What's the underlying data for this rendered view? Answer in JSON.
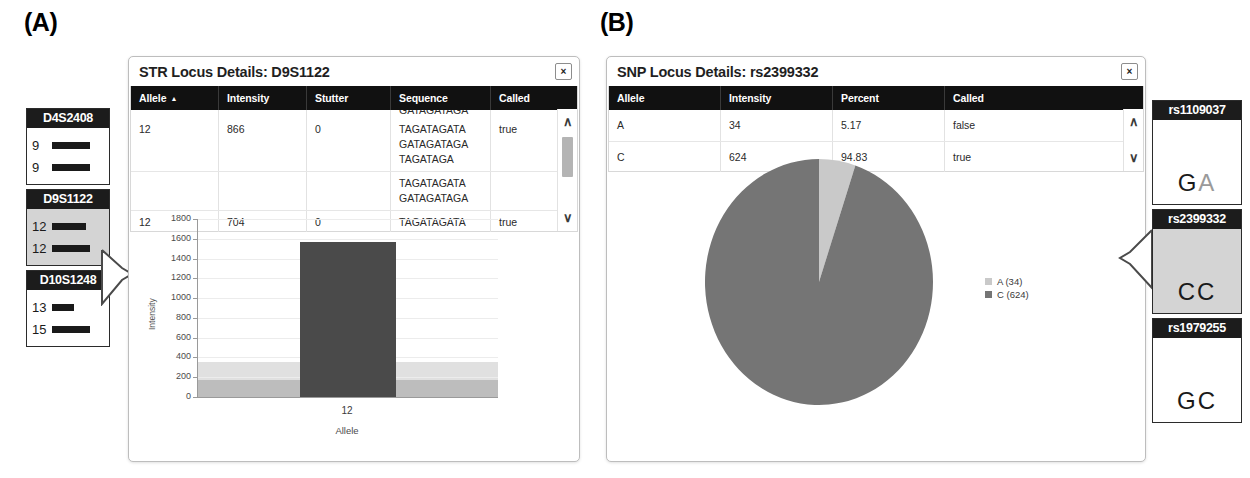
{
  "panels": {
    "a_letter": "(A)",
    "b_letter": "(B)"
  },
  "colors": {
    "header_bar": "#111111",
    "bar_fill": "#4a4a4a",
    "pie_major": "#757575",
    "pie_minor": "#c9c9c9",
    "selected_chip": "#d4d4d4",
    "band_light": "#e0e0e0",
    "band_dark": "#bdbdbd"
  },
  "panel_a": {
    "sidebar": {
      "loci": [
        {
          "name": "D4S2408",
          "selected": false,
          "alleles": [
            {
              "label": "9",
              "width": 38
            },
            {
              "label": "9",
              "width": 38
            }
          ]
        },
        {
          "name": "D9S1122",
          "selected": true,
          "alleles": [
            {
              "label": "12",
              "width": 34
            },
            {
              "label": "12",
              "width": 38
            }
          ]
        },
        {
          "name": "D10S1248",
          "selected": false,
          "alleles": [
            {
              "label": "13",
              "width": 22
            },
            {
              "label": "15",
              "width": 38
            }
          ]
        }
      ]
    },
    "dialog": {
      "title": "STR Locus Details: D9S1122",
      "close_label": "×",
      "table": {
        "columns": [
          "Allele",
          "Intensity",
          "Stutter",
          "Sequence",
          "Called"
        ],
        "sort_column": "Allele",
        "sort_arrow": "▲",
        "clipped_top_sequence": "GATAGATAGA",
        "rows": [
          {
            "allele": "12",
            "intensity": "866",
            "stutter": "0",
            "sequence": [
              "TAGATAGATA",
              "GATAGATAGA",
              "TAGATAGA"
            ],
            "called": "true"
          },
          {
            "allele": "",
            "intensity": "",
            "stutter": "",
            "sequence": [
              "TAGATAGATA",
              "GATAGATAGA"
            ],
            "called": ""
          },
          {
            "allele": "12",
            "intensity": "704",
            "stutter": "0",
            "sequence": [
              "TAGATAGATA"
            ],
            "called": "true"
          }
        ],
        "scroll_up": "∧",
        "scroll_down": "∨"
      }
    },
    "chart_data": {
      "type": "bar",
      "title": "",
      "xlabel": "Allele",
      "ylabel": "Intensity",
      "categories": [
        "12"
      ],
      "values": [
        1570
      ],
      "ylim": [
        0,
        1800
      ],
      "yticks": [
        0,
        200,
        400,
        600,
        800,
        1000,
        1200,
        1400,
        1600,
        1800
      ],
      "grid": true,
      "legend": "none",
      "threshold_bands": [
        {
          "name": "analytical-threshold-band",
          "from": 0,
          "to": 350,
          "color": "#e0e0e0"
        },
        {
          "name": "stutter-threshold-band",
          "from": 0,
          "to": 170,
          "color": "#bdbdbd"
        }
      ]
    }
  },
  "panel_b": {
    "dialog": {
      "title": "SNP Locus Details: rs2399332",
      "close_label": "×",
      "table": {
        "columns": [
          "Allele",
          "Intensity",
          "Percent",
          "Called"
        ],
        "rows": [
          {
            "allele": "A",
            "intensity": "34",
            "percent": "5.17",
            "called": "false"
          },
          {
            "allele": "C",
            "intensity": "624",
            "percent": "94.83",
            "called": "true"
          }
        ],
        "scroll_up": "∧",
        "scroll_down": "∨"
      }
    },
    "chart_data": {
      "type": "pie",
      "title": "",
      "labels": [
        "A (34)",
        "C (624)"
      ],
      "slice_names": [
        "A",
        "C"
      ],
      "values": [
        34,
        624
      ],
      "percents": [
        5.17,
        94.83
      ],
      "colors": [
        "#c9c9c9",
        "#757575"
      ],
      "legend": "right",
      "start_angle_deg": 0
    },
    "sidebar": {
      "loci": [
        {
          "name": "rs1109037",
          "selected": false,
          "call": [
            "G",
            "A"
          ],
          "dim_index": 1
        },
        {
          "name": "rs2399332",
          "selected": true,
          "call": [
            "C",
            "C"
          ],
          "dim_index": -1
        },
        {
          "name": "rs1979255",
          "selected": false,
          "call": [
            "G",
            "C"
          ],
          "dim_index": -1
        }
      ]
    }
  }
}
